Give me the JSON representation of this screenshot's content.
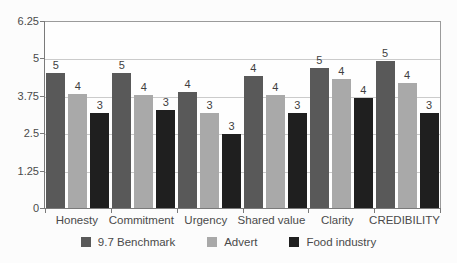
{
  "chart_data": {
    "type": "bar",
    "title": "",
    "categories": [
      "Honesty",
      "Commitment",
      "Urgency",
      "Shared value",
      "Clarity",
      "CREDIBILITY"
    ],
    "series": [
      {
        "name": "9.7 Benchmark",
        "color": "#595959",
        "values": [
          4.55,
          4.55,
          3.9,
          4.45,
          4.7,
          4.95
        ],
        "data_labels": [
          "5",
          "5",
          "4",
          "4",
          "5",
          "5"
        ]
      },
      {
        "name": "Advert",
        "color": "#a9a9a9",
        "values": [
          3.85,
          3.8,
          3.2,
          3.8,
          4.35,
          4.2
        ],
        "data_labels": [
          "4",
          "4",
          "3",
          "4",
          "4",
          "4"
        ]
      },
      {
        "name": "Food industry",
        "color": "#1f1f1f",
        "values": [
          3.2,
          3.3,
          2.5,
          3.2,
          3.7,
          3.2
        ],
        "data_labels": [
          "3",
          "3",
          "3",
          "3",
          "4",
          "3"
        ]
      }
    ],
    "y_axis": {
      "min": 0,
      "max": 6.25,
      "tick_values": [
        0,
        1.25,
        2.5,
        3.75,
        5,
        6.25
      ],
      "tick_labels": [
        "0",
        "1.25",
        "2.5",
        "3.75",
        "5",
        "6.25"
      ]
    },
    "grid": true,
    "legend_position": "bottom",
    "colors": {
      "gridline": "#cbcbcb",
      "axis": "#7a7a7a",
      "plot_border": "#9b9b9b",
      "text": "#4a4a4a",
      "background": "#fcfcfc"
    }
  }
}
